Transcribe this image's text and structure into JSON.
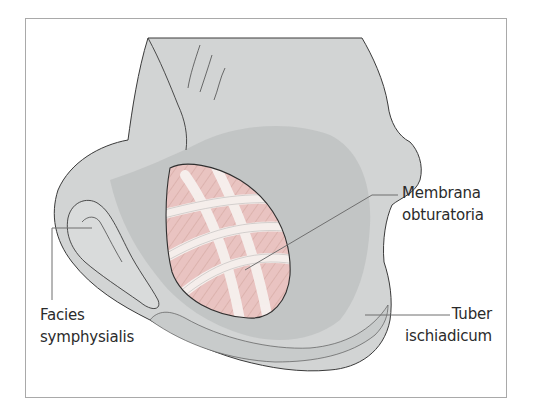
{
  "figure": {
    "colors": {
      "frame_border": "#a9a9a9",
      "bone_light": "#d2d4d4",
      "bone_mid": "#bfc2c2",
      "bone_dark": "#a7abab",
      "outline": "#3a3a3a",
      "membrane_pink": "#e9c4c1",
      "membrane_fibre": "#f7f1ef",
      "leader_line": "#6f6f6f"
    }
  },
  "labels": {
    "membrana_obturatoria": {
      "line1": "Membrana",
      "line2": "obturatoria"
    },
    "facies_symphysialis": {
      "line1": "Facies",
      "line2": "symphysialis"
    },
    "tuber_ischiadicum": {
      "line1": "Tuber",
      "line2": "ischiadicum"
    }
  }
}
